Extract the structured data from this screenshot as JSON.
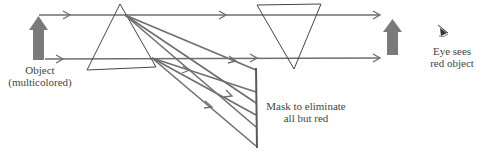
{
  "labels": {
    "object_line1": "Object",
    "object_line2": "(multicolored)",
    "mask_line1": "Mask to eliminate",
    "mask_line2": "all but red",
    "eye_line1": "Eye sees",
    "eye_line2": "red object"
  },
  "icons": {
    "object": "upward-arrow-icon",
    "image": "upward-arrow-icon",
    "eye": "eye-icon"
  },
  "colors": {
    "ray": "#6e6e6e",
    "prism": "#444444",
    "object_arrow": "#7a7a7a",
    "text": "#444444"
  }
}
